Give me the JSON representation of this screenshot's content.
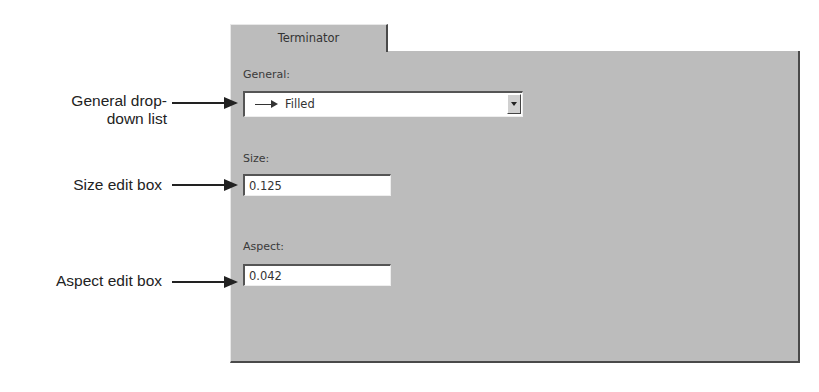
{
  "tab": {
    "label": "Terminator"
  },
  "fields": {
    "general": {
      "label": "General:",
      "value": "Filled",
      "icon": "filled-arrow-icon"
    },
    "size": {
      "label": "Size:",
      "value": "0.125"
    },
    "aspect": {
      "label": "Aspect:",
      "value": "0.042"
    }
  },
  "callouts": {
    "general_line1": "General drop-",
    "general_line2": "down list",
    "size": "Size edit box",
    "aspect": "Aspect edit box"
  }
}
